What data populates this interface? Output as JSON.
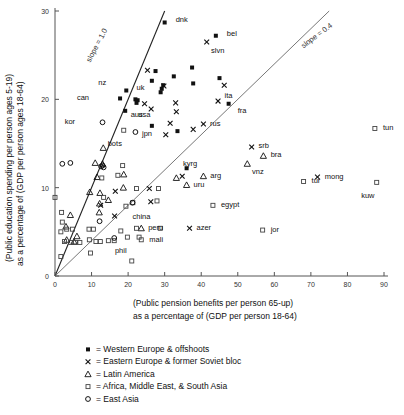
{
  "chart_data": {
    "type": "scatter",
    "title": "",
    "xlabel": "(Public pension benefits per person 65-up) as a percentage of (GDP per person 18-64)",
    "xlabel_line1": "(Public pension benefits per person 65-up)",
    "xlabel_line2": "as a percentage of (GDP per person 18-64)",
    "ylabel_line1": "(Public education spending per person ages 5-19)",
    "ylabel_line2": "as a percentage of (GDP per person ages 18-64)",
    "xlim": [
      0,
      90
    ],
    "ylim": [
      0,
      30
    ],
    "xticks": [
      0,
      10,
      20,
      30,
      40,
      50,
      60,
      70,
      80,
      90
    ],
    "yticks": [
      0,
      10,
      20,
      30
    ],
    "grid": false,
    "legend_position": "below-plot",
    "annotations": [
      {
        "text": "slope = 1.0",
        "x": 12,
        "y": 26
      },
      {
        "text": "slope = 0.4",
        "x": 72,
        "y": 27
      }
    ],
    "reference_lines": [
      {
        "name": "slope-1.0-line",
        "slope": 1.0,
        "intercept": 0,
        "color": "#222222"
      },
      {
        "name": "slope-0.4-line",
        "slope": 0.4,
        "intercept": 0,
        "color": "#777777"
      }
    ],
    "legend": [
      {
        "marker": "filled-square",
        "label": "= Western Europe & offshoots",
        "group": "Western Europe & offshoots"
      },
      {
        "marker": "x-cross",
        "label": "= Eastern Europe & former Soviet bloc",
        "group": "Eastern Europe & former Soviet bloc"
      },
      {
        "marker": "triangle",
        "label": "= Latin America",
        "group": "Latin America"
      },
      {
        "marker": "open-square",
        "label": "= Africa, Middle East, & South Asia",
        "group": "Africa, Middle East, & South Asia"
      },
      {
        "marker": "circle",
        "label": "= East Asia",
        "group": "East Asia"
      }
    ],
    "series": [
      {
        "name": "Western Europe & offshoots",
        "marker": "filled-square",
        "points": [
          {
            "x": 30.0,
            "y": 28.7,
            "label": "dnk",
            "lx": 3,
            "ly": 0.3
          },
          {
            "x": 44.0,
            "y": 27.2,
            "label": "bel",
            "lx": 3,
            "ly": 0.3
          },
          {
            "x": 37.5,
            "y": 23.6,
            "label": ""
          },
          {
            "x": 26.5,
            "y": 22.1,
            "label": ""
          },
          {
            "x": 27.5,
            "y": 23.2,
            "label": ""
          },
          {
            "x": 32.5,
            "y": 22.6,
            "label": ""
          },
          {
            "x": 37.8,
            "y": 21.8,
            "label": ""
          },
          {
            "x": 45.0,
            "y": 22.4,
            "label": ""
          },
          {
            "x": 29.2,
            "y": 21.2,
            "label": ""
          },
          {
            "x": 29.6,
            "y": 21.6,
            "label": ""
          },
          {
            "x": 28.9,
            "y": 20.8,
            "label": ""
          },
          {
            "x": 19.5,
            "y": 21.0,
            "label": "nz",
            "lx": -5.5,
            "ly": 0.9
          },
          {
            "x": 17.8,
            "y": 20.1,
            "label": "can",
            "lx": -8.5,
            "ly": 0.1
          },
          {
            "x": 22.0,
            "y": 20.0,
            "label": "uk",
            "lx": 0.3,
            "ly": 1.3
          },
          {
            "x": 22.6,
            "y": 19.9,
            "label": ""
          },
          {
            "x": 22.3,
            "y": 19.6,
            "label": ""
          },
          {
            "x": 19.2,
            "y": 18.7,
            "label": "aus",
            "lx": 1.5,
            "ly": -0.4
          },
          {
            "x": 47.5,
            "y": 19.5,
            "label": "fra",
            "lx": 2.5,
            "ly": -0.8
          },
          {
            "x": 26.5,
            "y": 17.0,
            "label": "usa",
            "lx": -0.4,
            "ly": 1.3
          },
          {
            "x": 33.5,
            "y": 16.4,
            "label": ""
          },
          {
            "x": 36.0,
            "y": 12.2,
            "label": ""
          }
        ]
      },
      {
        "name": "Eastern Europe & former Soviet bloc",
        "marker": "x-cross",
        "points": [
          {
            "x": 41.5,
            "y": 26.5,
            "label": "slvn",
            "lx": 1.2,
            "ly": -1.0
          },
          {
            "x": 25.3,
            "y": 23.3,
            "label": ""
          },
          {
            "x": 29.8,
            "y": 21.5,
            "label": ""
          },
          {
            "x": 46.3,
            "y": 21.6,
            "label": ""
          },
          {
            "x": 24.5,
            "y": 19.5,
            "label": ""
          },
          {
            "x": 26.3,
            "y": 18.9,
            "label": ""
          },
          {
            "x": 33.0,
            "y": 19.6,
            "label": ""
          },
          {
            "x": 33.2,
            "y": 18.6,
            "label": ""
          },
          {
            "x": 44.6,
            "y": 19.8,
            "label": "ita",
            "lx": 1.8,
            "ly": 0.6
          },
          {
            "x": 31.5,
            "y": 17.3,
            "label": ""
          },
          {
            "x": 37.8,
            "y": 16.6,
            "label": ""
          },
          {
            "x": 40.6,
            "y": 17.2,
            "label": "rus",
            "lx": 1.8,
            "ly": 0.1
          },
          {
            "x": 30.3,
            "y": 16.0,
            "label": ""
          },
          {
            "x": 53.8,
            "y": 14.6,
            "label": "srb",
            "lx": 1.9,
            "ly": 0.2
          },
          {
            "x": 34.8,
            "y": 11.3,
            "label": "kyrg",
            "lx": 0.2,
            "ly": 1.4
          },
          {
            "x": 71.8,
            "y": 11.2,
            "label": "mong",
            "lx": 2.0,
            "ly": 0.1
          },
          {
            "x": 25.8,
            "y": 9.9,
            "label": ""
          },
          {
            "x": 16.5,
            "y": 9.6,
            "label": ""
          },
          {
            "x": 26.2,
            "y": 8.4,
            "label": ""
          },
          {
            "x": 12.5,
            "y": 8.0,
            "label": ""
          },
          {
            "x": 16.3,
            "y": 6.8,
            "label": ""
          },
          {
            "x": 36.8,
            "y": 5.4,
            "label": "azer",
            "lx": 1.9,
            "ly": 0.1
          }
        ]
      },
      {
        "name": "Latin America",
        "marker": "triangle",
        "points": [
          {
            "x": 57.0,
            "y": 13.6,
            "label": "bra",
            "lx": 2.0,
            "ly": 0.2
          },
          {
            "x": 52.6,
            "y": 12.7,
            "label": "vnz",
            "lx": 1.3,
            "ly": -0.9
          },
          {
            "x": 40.6,
            "y": 11.3,
            "label": "arg",
            "lx": 1.9,
            "ly": 0.1
          },
          {
            "x": 33.2,
            "y": 11.1,
            "label": ""
          },
          {
            "x": 36.0,
            "y": 10.3,
            "label": "uru",
            "lx": 1.9,
            "ly": 0.1
          },
          {
            "x": 13.2,
            "y": 14.5,
            "label": ""
          },
          {
            "x": 13.0,
            "y": 12.7,
            "label": ""
          },
          {
            "x": 18.8,
            "y": 11.5,
            "label": ""
          },
          {
            "x": 11.5,
            "y": 11.2,
            "label": ""
          },
          {
            "x": 18.7,
            "y": 10.0,
            "label": ""
          },
          {
            "x": 12.3,
            "y": 9.4,
            "label": ""
          },
          {
            "x": 14.6,
            "y": 8.6,
            "label": ""
          },
          {
            "x": 12.2,
            "y": 8.2,
            "label": ""
          },
          {
            "x": 12.1,
            "y": 7.2,
            "label": ""
          },
          {
            "x": 4.2,
            "y": 6.9,
            "label": ""
          },
          {
            "x": 3.0,
            "y": 5.6,
            "label": ""
          },
          {
            "x": 23.6,
            "y": 5.4,
            "label": "peru",
            "lx": 1.9,
            "ly": 0.1
          },
          {
            "x": 6.0,
            "y": 4.5,
            "label": ""
          },
          {
            "x": 5.2,
            "y": 3.9,
            "label": ""
          },
          {
            "x": 3.2,
            "y": 4.1,
            "label": ""
          },
          {
            "x": 9.5,
            "y": 9.5,
            "label": ""
          },
          {
            "x": 11.0,
            "y": 12.8,
            "label": ""
          }
        ]
      },
      {
        "name": "Africa, Middle East, & South Asia",
        "marker": "open-square",
        "points": [
          {
            "x": 87.5,
            "y": 16.7,
            "label": "tun",
            "lx": 2.2,
            "ly": 0.1
          },
          {
            "x": 18.8,
            "y": 16.5,
            "label": "bots",
            "lx": -0.5,
            "ly": -1.5
          },
          {
            "x": 68.0,
            "y": 10.7,
            "label": "tur",
            "lx": 2.2,
            "ly": 0.1
          },
          {
            "x": 88.0,
            "y": 10.6,
            "label": "kuw",
            "lx": -0.6,
            "ly": -1.5
          },
          {
            "x": 43.2,
            "y": 8.0,
            "label": "egypt",
            "lx": 2.2,
            "ly": 0.1
          },
          {
            "x": 56.8,
            "y": 5.2,
            "label": "jor",
            "lx": 2.2,
            "ly": 0.1
          },
          {
            "x": 23.6,
            "y": 4.1,
            "label": "mali",
            "lx": 2.2,
            "ly": 0.1
          },
          {
            "x": 18.5,
            "y": 12.5,
            "label": ""
          },
          {
            "x": 17.2,
            "y": 11.4,
            "label": ""
          },
          {
            "x": 12.8,
            "y": 11.1,
            "label": ""
          },
          {
            "x": 28.3,
            "y": 9.9,
            "label": ""
          },
          {
            "x": 22.3,
            "y": 9.9,
            "label": ""
          },
          {
            "x": 27.9,
            "y": 8.5,
            "label": ""
          },
          {
            "x": 21.3,
            "y": 8.3,
            "label": ""
          },
          {
            "x": 19.4,
            "y": 7.9,
            "label": ""
          },
          {
            "x": 13.3,
            "y": 8.9,
            "label": ""
          },
          {
            "x": 0.0,
            "y": 8.9,
            "label": ""
          },
          {
            "x": 1.8,
            "y": 7.2,
            "label": ""
          },
          {
            "x": 2.0,
            "y": 6.1,
            "label": ""
          },
          {
            "x": 3.2,
            "y": 5.3,
            "label": ""
          },
          {
            "x": 4.8,
            "y": 5.3,
            "label": ""
          },
          {
            "x": 1.6,
            "y": 5.0,
            "label": ""
          },
          {
            "x": 9.3,
            "y": 5.3,
            "label": ""
          },
          {
            "x": 10.5,
            "y": 5.3,
            "label": ""
          },
          {
            "x": 18.0,
            "y": 5.1,
            "label": ""
          },
          {
            "x": 22.3,
            "y": 5.4,
            "label": ""
          },
          {
            "x": 28.8,
            "y": 5.4,
            "label": ""
          },
          {
            "x": 19.8,
            "y": 4.4,
            "label": ""
          },
          {
            "x": 23.0,
            "y": 4.4,
            "label": ""
          },
          {
            "x": 9.4,
            "y": 4.1,
            "label": ""
          },
          {
            "x": 11.2,
            "y": 3.9,
            "label": ""
          },
          {
            "x": 12.4,
            "y": 3.9,
            "label": ""
          },
          {
            "x": 14.6,
            "y": 4.0,
            "label": ""
          },
          {
            "x": 16.2,
            "y": 4.0,
            "label": ""
          },
          {
            "x": 4.3,
            "y": 3.8,
            "label": ""
          },
          {
            "x": 5.6,
            "y": 3.8,
            "label": ""
          },
          {
            "x": 6.8,
            "y": 3.8,
            "label": ""
          },
          {
            "x": 1.6,
            "y": 2.2,
            "label": ""
          },
          {
            "x": 9.7,
            "y": 2.6,
            "label": ""
          },
          {
            "x": 21.0,
            "y": 1.7,
            "label": ""
          },
          {
            "x": 2.6,
            "y": 3.9,
            "label": ""
          }
        ]
      },
      {
        "name": "East Asia",
        "marker": "circle",
        "points": [
          {
            "x": 13.0,
            "y": 17.4,
            "label": "kor",
            "lx": -7.5,
            "ly": 0.1
          },
          {
            "x": 22.0,
            "y": 16.3,
            "label": "jpn",
            "lx": 1.8,
            "ly": -0.1
          },
          {
            "x": 2.0,
            "y": 12.7,
            "label": ""
          },
          {
            "x": 4.2,
            "y": 12.8,
            "label": ""
          },
          {
            "x": 12.6,
            "y": 12.4,
            "label": ""
          },
          {
            "x": 13.0,
            "y": 12.5,
            "label": ""
          },
          {
            "x": 13.3,
            "y": 12.3,
            "label": ""
          },
          {
            "x": 21.2,
            "y": 8.3,
            "label": "china",
            "lx": 0.0,
            "ly": -1.5
          },
          {
            "x": 12.2,
            "y": 6.2,
            "label": ""
          },
          {
            "x": 16.2,
            "y": 4.3,
            "label": "phil",
            "lx": 0.2,
            "ly": -1.4
          }
        ]
      }
    ]
  }
}
